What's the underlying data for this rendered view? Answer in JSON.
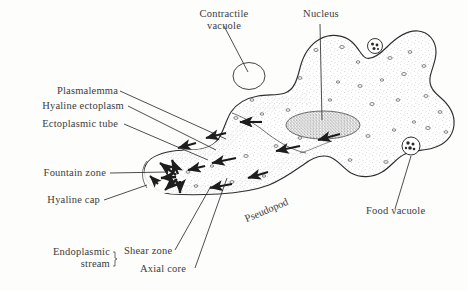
{
  "figure": {
    "background_color": "#fdfdfc",
    "ink_color": "#2e2e2e",
    "text_color": "#3b3b3b",
    "stipple_color": "#8d8d8d",
    "width": 468,
    "height": 291
  },
  "labels": {
    "contractile_vacuole_line1": "Contractile",
    "contractile_vacuole_line2": "vacuole",
    "nucleus": "Nucleus",
    "plasmalemma": "Plasmalemma",
    "hyaline_ectoplasm": "Hyaline ectoplasm",
    "ectoplasmic_tube": "Ectoplasmic tube",
    "fountain_zone": "Fountain zone",
    "hyaline_cap": "Hyaline cap",
    "endoplasmic_stream_line1": "Endoplasmic",
    "endoplasmic_stream_line2": "stream",
    "shear_zone": "Shear zone",
    "axial_core": "Axial core",
    "pseudopod": "Pseudopod",
    "food_vacuole": "Food vacuole"
  },
  "structures": [
    {
      "name": "contractile-vacuole",
      "kind": "open-circle",
      "description": "clear circular vesicle in upper left lobe"
    },
    {
      "name": "nucleus",
      "kind": "stippled-ellipse",
      "description": "dense stippled ellipse at cell center"
    },
    {
      "name": "food-vacuole-lower",
      "kind": "granular-circle",
      "description": "small circle with dark granules, lower right lobe"
    },
    {
      "name": "food-vacuole-upper",
      "kind": "granular-circle",
      "description": "small circle with dark granules, upper right lobe"
    },
    {
      "name": "hyaline-cap",
      "kind": "clear-zone",
      "description": "unstippled clear region at pseudopod tip"
    },
    {
      "name": "fountain-zone",
      "kind": "arrow-cluster",
      "description": "arrows radiating outward at pseudopod tip"
    },
    {
      "name": "axial-core",
      "kind": "flow-region",
      "description": "central endoplasmic flow channel along pseudopod"
    },
    {
      "name": "shear-zone",
      "kind": "boundary",
      "description": "interface between moving endoplasm and stationary ectoplasm"
    },
    {
      "name": "ectoplasmic-tube",
      "kind": "outer-layer",
      "description": "stationary gel-like outer cytoplasm layer"
    },
    {
      "name": "plasmalemma",
      "kind": "membrane",
      "description": "outer cell membrane boundary"
    }
  ],
  "flow_arrows": [
    {
      "region": "upper-pseudopod",
      "direction": "toward-tip"
    },
    {
      "region": "axial-core",
      "direction": "toward-tip"
    },
    {
      "region": "fountain-zone",
      "direction": "radiating-outward"
    },
    {
      "region": "lower-pseudopod",
      "direction": "toward-tip"
    },
    {
      "region": "main-body",
      "direction": "toward-pseudopod"
    }
  ]
}
